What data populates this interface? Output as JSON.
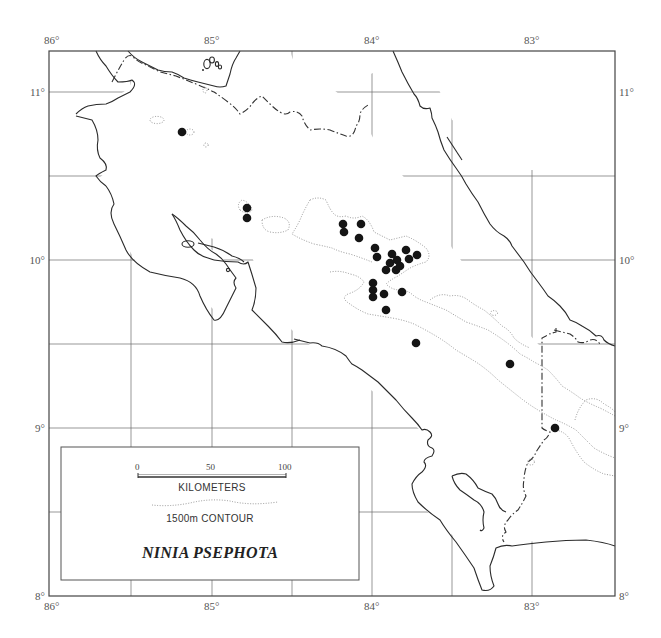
{
  "map": {
    "title": "NINIA PSEPHOTA",
    "frame": {
      "left": 49,
      "top": 51,
      "right": 615,
      "bottom": 596
    },
    "longitude_labels_top": [
      {
        "text": "86°",
        "x": 44
      },
      {
        "text": "85°",
        "x": 204
      },
      {
        "text": "84°",
        "x": 364
      },
      {
        "text": "83°",
        "x": 524
      }
    ],
    "longitude_labels_bottom": [
      {
        "text": "86°",
        "x": 44
      },
      {
        "text": "85°",
        "x": 204
      },
      {
        "text": "84°",
        "x": 364
      },
      {
        "text": "83°",
        "x": 524
      }
    ],
    "latitude_labels_left": [
      {
        "text": "11°",
        "y": 96
      },
      {
        "text": "10°",
        "y": 264
      },
      {
        "text": "9°",
        "y": 432
      },
      {
        "text": "8°",
        "y": 600
      }
    ],
    "latitude_labels_right": [
      {
        "text": "11°",
        "y": 96
      },
      {
        "text": "10°",
        "y": 264
      },
      {
        "text": "9°",
        "y": 432
      },
      {
        "text": "8°",
        "y": 600
      }
    ],
    "grid_x": [
      131,
      212,
      292,
      372,
      452,
      532
    ],
    "grid_y": [
      92,
      176,
      260,
      344,
      428,
      512
    ],
    "locality_points": [
      [
        182,
        132
      ],
      [
        247,
        208
      ],
      [
        247,
        218
      ],
      [
        343,
        224
      ],
      [
        344,
        232
      ],
      [
        361,
        224
      ],
      [
        359,
        238
      ],
      [
        375,
        248
      ],
      [
        377,
        257
      ],
      [
        392,
        254
      ],
      [
        406,
        250
      ],
      [
        417,
        255
      ],
      [
        409,
        259
      ],
      [
        390,
        263
      ],
      [
        397,
        260
      ],
      [
        386,
        270
      ],
      [
        396,
        270
      ],
      [
        400,
        266
      ],
      [
        373,
        283
      ],
      [
        373,
        290
      ],
      [
        373,
        297
      ],
      [
        384,
        294
      ],
      [
        402,
        292
      ],
      [
        386,
        310
      ],
      [
        416,
        343
      ],
      [
        510,
        364
      ],
      [
        555,
        428
      ]
    ],
    "dot_color": "#151515"
  },
  "legend": {
    "scale": {
      "ticks": [
        "0",
        "50",
        "100"
      ],
      "unit_label": "KILOMETERS"
    },
    "contour_label": "1500m CONTOUR",
    "species_title": "NINIA PSEPHOTA"
  }
}
